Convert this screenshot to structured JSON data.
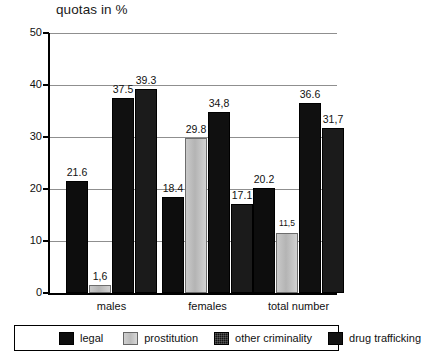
{
  "chart_data": {
    "type": "bar",
    "title": "quotas in %",
    "xlabel": "",
    "ylabel": "",
    "ylim": [
      0,
      50
    ],
    "yticks": [
      "0",
      "10",
      "20",
      "30",
      "40",
      "50"
    ],
    "grid": true,
    "legend_position": "bottom",
    "categories": [
      "males",
      "females",
      "total number"
    ],
    "series": [
      {
        "name": "legal",
        "values": [
          21.6,
          18.4,
          20.2
        ],
        "labels": [
          "21.6",
          "18.4",
          "20.2"
        ],
        "color": "#0d0d0d"
      },
      {
        "name": "prostitution",
        "values": [
          1.6,
          29.8,
          11.5
        ],
        "labels": [
          "1,6",
          "29.8",
          "11,5"
        ],
        "color": "#c4c4c4"
      },
      {
        "name": "other criminality",
        "values": [
          37.5,
          34.8,
          36.6
        ],
        "labels": [
          "37.5",
          "34,8",
          "36.6"
        ],
        "color": "#101010"
      },
      {
        "name": "drug trafficking",
        "values": [
          39.3,
          17.1,
          31.7
        ],
        "labels": [
          "39.3",
          "17.1",
          "31,7"
        ],
        "color": "#1b1b1b"
      }
    ]
  },
  "legend": {
    "items": [
      {
        "label": "legal"
      },
      {
        "label": "prostitution"
      },
      {
        "label": "other criminality"
      },
      {
        "label": "drug trafficking"
      }
    ]
  }
}
